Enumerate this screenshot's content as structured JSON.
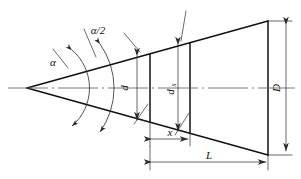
{
  "diagram": {
    "type": "engineering-drawing",
    "canvas": {
      "width": 301,
      "height": 179,
      "background": "#ffffff"
    },
    "colors": {
      "outline": "#111111",
      "thin_line": "#2a2a2a",
      "centerline": "#555555",
      "text": "#111111"
    },
    "geometry": {
      "apex": {
        "x": 27,
        "y": 88
      },
      "axis_y": 88,
      "top_edge_end": {
        "x": 268,
        "y": 21
      },
      "bottom_edge_end": {
        "x": 268,
        "y": 155
      },
      "section_d_x": 150,
      "section_dx_x": 190,
      "base_x": 268,
      "dim_D_x": 283,
      "dim_x_y": 139,
      "dim_L_y": 162
    },
    "labels": {
      "alpha": "α",
      "alpha_half": "α/2",
      "diameter_d": "d",
      "diameter_dx_base": "d",
      "diameter_dx_sub": "x",
      "diameter_D": "D",
      "length_x": "x",
      "length_L": "L"
    },
    "annotations": [
      {
        "name": "cone-half-angle",
        "symbol": "α/2",
        "meaning": "half apex angle"
      },
      {
        "name": "cone-full-angle",
        "symbol": "α",
        "meaning": "full apex angle"
      },
      {
        "name": "small-diameter",
        "symbol": "d",
        "meaning": "small end diameter"
      },
      {
        "name": "section-diameter",
        "symbol": "dx",
        "meaning": "diameter at distance x"
      },
      {
        "name": "large-diameter",
        "symbol": "D",
        "meaning": "large end diameter"
      },
      {
        "name": "partial-length",
        "symbol": "x",
        "meaning": "distance from small end"
      },
      {
        "name": "total-length",
        "symbol": "L",
        "meaning": "cone length"
      }
    ]
  }
}
